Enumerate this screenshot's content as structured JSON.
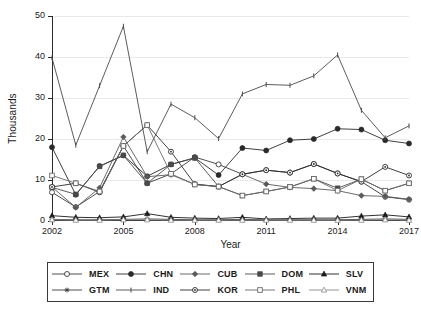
{
  "chart_data": {
    "type": "line",
    "title": "",
    "xlabel": "Year",
    "ylabel": "Thousands",
    "xlim": [
      2002,
      2017
    ],
    "ylim": [
      0,
      50
    ],
    "yticks": [
      0,
      10,
      20,
      30,
      40,
      50
    ],
    "xticks": [
      2002,
      2005,
      2008,
      2011,
      2014,
      2017
    ],
    "ytick_labels": [
      "0",
      "10",
      "20",
      "30",
      "40",
      "50"
    ],
    "xtick_labels": [
      "2002",
      "2005",
      "2008",
      "2011",
      "2014",
      "2017"
    ],
    "grid": "horizontal",
    "legend_position": "below",
    "x": [
      2002,
      2003,
      2004,
      2005,
      2006,
      2007,
      2008,
      2009,
      2010,
      2011,
      2012,
      2013,
      2014,
      2015,
      2016,
      2017
    ],
    "series": [
      {
        "name": "MEX",
        "marker": "open-circle",
        "color": "#3a3a3a",
        "values": [
          7.0,
          3.4,
          7.2,
          18.3,
          9.2,
          11.5,
          15.6,
          13.8,
          11.4,
          12.4,
          11.8,
          13.9,
          11.6,
          9.6,
          5.9,
          5.2
        ]
      },
      {
        "name": "CHN",
        "marker": "filled-circle",
        "color": "#2a2a2a",
        "values": [
          18.0,
          6.4,
          13.4,
          16.0,
          10.9,
          13.8,
          15.4,
          11.2,
          17.8,
          17.2,
          19.7,
          20.0,
          22.5,
          22.3,
          19.7,
          18.9
        ]
      },
      {
        "name": "CUB",
        "marker": "filled-diamond",
        "color": "#5a5a5a",
        "values": [
          8.3,
          3.3,
          8.1,
          20.5,
          10.8,
          11.3,
          8.9,
          8.4,
          11.4,
          9.0,
          8.2,
          7.9,
          7.4,
          6.2,
          6.0,
          5.3
        ]
      },
      {
        "name": "DOM",
        "marker": "filled-square",
        "color": "#4a4a4a",
        "values": [
          8.2,
          6.5,
          13.3,
          16.0,
          9.2,
          13.8,
          15.4,
          8.4,
          6.2,
          7.2,
          8.3,
          10.3,
          8.0,
          10.2,
          7.4,
          9.2
        ]
      },
      {
        "name": "SLV",
        "marker": "filled-triangle",
        "color": "#1a1a1a",
        "values": [
          1.3,
          0.9,
          0.8,
          1.0,
          1.8,
          0.9,
          0.7,
          0.6,
          0.9,
          0.5,
          0.6,
          0.7,
          0.7,
          1.2,
          1.5,
          1.0
        ]
      },
      {
        "name": "GTM",
        "marker": "star",
        "color": "#3a3a3a",
        "values": [
          0.4,
          0.3,
          0.3,
          0.4,
          0.5,
          0.4,
          0.3,
          0.3,
          0.4,
          0.3,
          0.3,
          0.3,
          0.3,
          0.4,
          0.5,
          0.4
        ]
      },
      {
        "name": "IND",
        "marker": "tick",
        "color": "#4a4a4a",
        "values": [
          39.8,
          18.5,
          33.0,
          47.5,
          16.9,
          28.5,
          25.2,
          20.1,
          31.0,
          33.3,
          33.1,
          35.4,
          40.5,
          27.0,
          20.3,
          23.2
        ]
      },
      {
        "name": "KOR",
        "marker": "dot-circle",
        "color": "#2a2a2a",
        "values": [
          8.3,
          9.2,
          7.0,
          18.3,
          23.4,
          16.9,
          9.0,
          8.4,
          11.4,
          12.4,
          11.8,
          13.9,
          11.6,
          9.6,
          13.2,
          11.1
        ]
      },
      {
        "name": "PHL",
        "marker": "open-square",
        "color": "#6a6a6a",
        "values": [
          11.1,
          9.2,
          7.2,
          18.3,
          23.4,
          11.5,
          8.9,
          8.4,
          6.2,
          7.2,
          8.3,
          10.3,
          7.4,
          10.2,
          7.4,
          9.2
        ]
      },
      {
        "name": "VNM",
        "marker": "light-triangle",
        "color": "#8a8a8a",
        "values": [
          0.3,
          0.2,
          0.2,
          0.3,
          0.3,
          0.2,
          0.2,
          0.2,
          0.2,
          0.2,
          0.2,
          0.2,
          0.2,
          0.2,
          0.3,
          0.2
        ]
      }
    ]
  },
  "legend": {
    "rows": [
      [
        "MEX",
        "CHN",
        "CUB",
        "DOM",
        "SLV"
      ],
      [
        "GTM",
        "IND",
        "KOR",
        "PHL",
        "VNM"
      ]
    ]
  }
}
